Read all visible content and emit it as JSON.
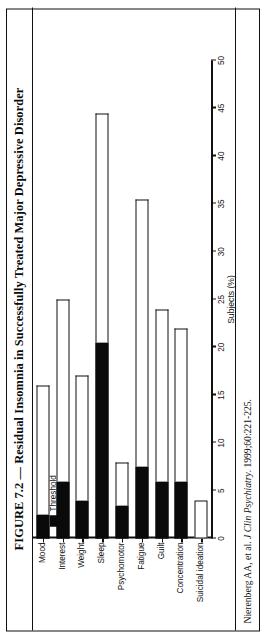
{
  "figure": {
    "title": "FIGURE 7.2 — Residual Insomnia in Successfully Treated Major Depressive Disorder",
    "citation_prefix": "Nierenberg AA, et al. ",
    "citation_journal": "J Clin Psychiatry",
    "citation_suffix": ". 1999;60:221-225."
  },
  "legend": {
    "subthreshold_label": "Subthreshold",
    "threshold_label": "Threshold",
    "n_prefix": "n",
    "n_value": "=108",
    "subthreshold_color": "#ffffff",
    "threshold_color": "#0a0a0a"
  },
  "chart_data": {
    "type": "bar",
    "orientation": "horizontal",
    "title": "Residual Insomnia in Successfully Treated Major Depressive Disorder",
    "xlabel": "Subjects (%)",
    "ylabel": "",
    "xlim": [
      0,
      50
    ],
    "xticks": [
      0,
      5,
      10,
      15,
      20,
      25,
      30,
      35,
      40,
      45,
      50
    ],
    "grid": false,
    "legend_position": "top-left",
    "stacked": true,
    "categories": [
      "Mood",
      "Interest",
      "Weight",
      "Sleep",
      "Psychomotor",
      "Fatigue",
      "Guilt",
      "Concentration",
      "Suicidal ideation"
    ],
    "series": [
      {
        "name": "Threshold",
        "color": "#0a0a0a",
        "values": [
          2.5,
          6.0,
          4.0,
          20.5,
          3.5,
          7.5,
          6.0,
          6.0,
          0.0
        ]
      },
      {
        "name": "Subthreshold",
        "color": "#ffffff",
        "values": [
          13.5,
          19.0,
          13.0,
          24.0,
          4.5,
          28.0,
          18.0,
          16.0,
          4.0
        ]
      }
    ],
    "totals": [
      16.0,
      25.0,
      17.0,
      44.5,
      8.0,
      35.5,
      24.0,
      22.0,
      4.0
    ],
    "n": 108
  }
}
